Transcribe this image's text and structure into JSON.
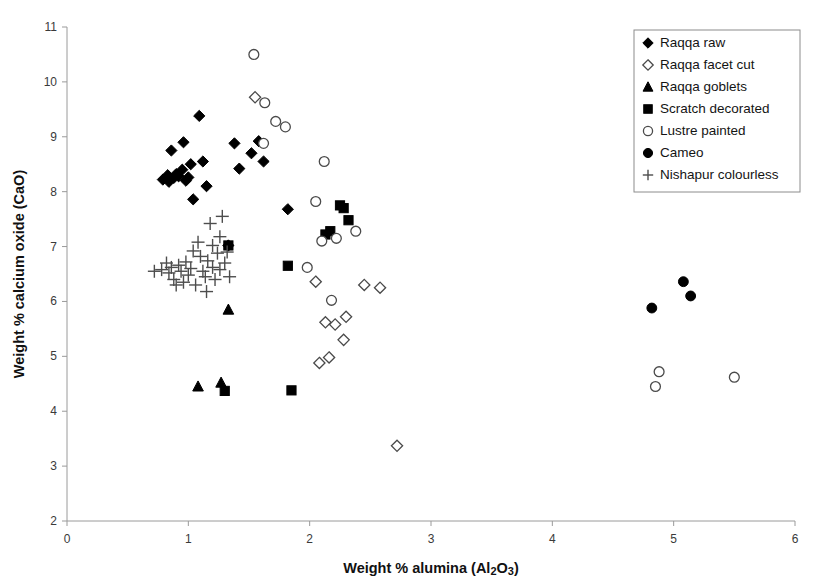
{
  "chart_data": {
    "type": "scatter",
    "title": "",
    "xlabel": "Weight % alumina (Al2O3)",
    "xlabel_parts": {
      "pre": "Weight % alumina (Al",
      "sub1": "2",
      "mid": "O",
      "sub2": "3",
      "post": ")"
    },
    "ylabel": "Weight % calcium oxide (CaO)",
    "xlim": [
      0,
      6
    ],
    "ylim": [
      2,
      11
    ],
    "xticks": [
      0,
      1,
      2,
      3,
      4,
      5,
      6
    ],
    "yticks": [
      2,
      3,
      4,
      5,
      6,
      7,
      8,
      9,
      10,
      11
    ],
    "xtick_labels": [
      "0",
      "1",
      "2",
      "3",
      "4",
      "5",
      "6"
    ],
    "ytick_labels": [
      "2",
      "3",
      "4",
      "5",
      "6",
      "7",
      "8",
      "9",
      "10",
      "11"
    ],
    "grid": false,
    "legend_position": "top-right",
    "marker_color": "#000000",
    "open_marker_stroke": "#4a4a4a",
    "series": [
      {
        "name": "Raqqa raw",
        "marker": "diamond-filled",
        "points": [
          [
            0.79,
            8.22
          ],
          [
            0.83,
            8.3
          ],
          [
            0.84,
            8.18
          ],
          [
            0.86,
            8.75
          ],
          [
            0.88,
            8.25
          ],
          [
            0.9,
            8.32
          ],
          [
            0.92,
            8.28
          ],
          [
            0.95,
            8.4
          ],
          [
            0.96,
            8.9
          ],
          [
            0.98,
            8.2
          ],
          [
            1.0,
            8.26
          ],
          [
            1.02,
            8.5
          ],
          [
            1.04,
            7.86
          ],
          [
            1.09,
            9.38
          ],
          [
            1.12,
            8.55
          ],
          [
            1.15,
            8.1
          ],
          [
            1.38,
            8.88
          ],
          [
            1.42,
            8.42
          ],
          [
            1.52,
            8.7
          ],
          [
            1.58,
            8.92
          ],
          [
            1.62,
            8.55
          ],
          [
            1.82,
            7.68
          ],
          [
            1.33,
            7.02
          ]
        ]
      },
      {
        "name": "Raqqa facet cut",
        "marker": "diamond-open",
        "points": [
          [
            1.55,
            9.72
          ],
          [
            2.05,
            6.36
          ],
          [
            2.08,
            4.88
          ],
          [
            2.16,
            4.98
          ],
          [
            2.13,
            5.62
          ],
          [
            2.21,
            5.58
          ],
          [
            2.3,
            5.72
          ],
          [
            2.28,
            5.3
          ],
          [
            2.45,
            6.3
          ],
          [
            2.58,
            6.25
          ],
          [
            2.72,
            3.37
          ]
        ]
      },
      {
        "name": "Raqqa goblets",
        "marker": "triangle-filled",
        "points": [
          [
            1.33,
            5.85
          ],
          [
            1.08,
            4.45
          ],
          [
            1.27,
            4.52
          ]
        ]
      },
      {
        "name": "Scratch decorated",
        "marker": "square-filled",
        "points": [
          [
            1.33,
            7.02
          ],
          [
            1.82,
            6.65
          ],
          [
            1.85,
            4.38
          ],
          [
            1.3,
            4.37
          ],
          [
            2.13,
            7.22
          ],
          [
            2.17,
            7.28
          ],
          [
            2.25,
            7.75
          ],
          [
            2.28,
            7.7
          ],
          [
            2.32,
            7.48
          ]
        ]
      },
      {
        "name": "Lustre painted",
        "marker": "circle-open",
        "points": [
          [
            1.54,
            10.5
          ],
          [
            1.63,
            9.62
          ],
          [
            1.72,
            9.28
          ],
          [
            1.8,
            9.18
          ],
          [
            1.62,
            8.88
          ],
          [
            2.12,
            8.55
          ],
          [
            2.05,
            7.82
          ],
          [
            2.1,
            7.1
          ],
          [
            2.22,
            7.15
          ],
          [
            2.38,
            7.28
          ],
          [
            1.98,
            6.62
          ],
          [
            2.18,
            6.02
          ],
          [
            4.85,
            4.45
          ],
          [
            4.88,
            4.72
          ],
          [
            5.5,
            4.62
          ]
        ]
      },
      {
        "name": "Cameo",
        "marker": "circle-filled",
        "points": [
          [
            4.82,
            5.88
          ],
          [
            5.08,
            6.36
          ],
          [
            5.14,
            6.1
          ]
        ]
      },
      {
        "name": "Nishapur colourless",
        "marker": "plus",
        "points": [
          [
            0.78,
            6.58
          ],
          [
            0.82,
            6.7
          ],
          [
            0.84,
            6.52
          ],
          [
            0.86,
            6.62
          ],
          [
            0.88,
            6.4
          ],
          [
            0.9,
            6.3
          ],
          [
            0.92,
            6.66
          ],
          [
            0.94,
            6.55
          ],
          [
            0.96,
            6.35
          ],
          [
            0.98,
            6.72
          ],
          [
            1.0,
            6.48
          ],
          [
            1.02,
            6.6
          ],
          [
            1.04,
            6.92
          ],
          [
            1.06,
            6.3
          ],
          [
            1.08,
            7.08
          ],
          [
            1.1,
            6.82
          ],
          [
            1.12,
            6.55
          ],
          [
            1.14,
            6.45
          ],
          [
            1.16,
            6.74
          ],
          [
            1.18,
            7.42
          ],
          [
            1.2,
            6.62
          ],
          [
            1.22,
            6.4
          ],
          [
            1.24,
            6.88
          ],
          [
            1.26,
            6.58
          ],
          [
            1.28,
            7.55
          ],
          [
            1.3,
            6.7
          ],
          [
            1.15,
            6.18
          ],
          [
            0.72,
            6.55
          ],
          [
            1.32,
            6.9
          ],
          [
            1.34,
            6.45
          ],
          [
            1.26,
            7.18
          ],
          [
            1.2,
            7.02
          ]
        ]
      }
    ]
  },
  "legend": {
    "items": [
      {
        "label": "Raqqa raw",
        "marker": "diamond-filled"
      },
      {
        "label": "Raqqa facet cut",
        "marker": "diamond-open"
      },
      {
        "label": "Raqqa goblets",
        "marker": "triangle-filled"
      },
      {
        "label": "Scratch decorated",
        "marker": "square-filled"
      },
      {
        "label": "Lustre painted",
        "marker": "circle-open"
      },
      {
        "label": "Cameo",
        "marker": "circle-filled"
      },
      {
        "label": "Nishapur colourless",
        "marker": "plus"
      }
    ]
  }
}
